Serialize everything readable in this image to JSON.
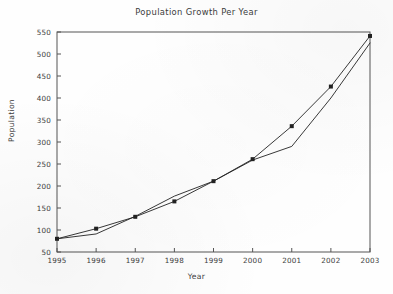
{
  "figure": {
    "title": "Population Growth Per Year",
    "xlabel": "Year",
    "ylabel": "Population",
    "background_color": "#fefefe",
    "line_color": "#222222",
    "axis_color": "#555555"
  },
  "chart_data": {
    "type": "line",
    "title": "Population Growth Per Year",
    "xlabel": "Year",
    "ylabel": "Population",
    "xlim": [
      1995,
      2003
    ],
    "ylim": [
      50,
      550
    ],
    "xticks": [
      1995,
      1996,
      1997,
      1998,
      1999,
      2000,
      2001,
      2002,
      2003
    ],
    "yticks": [
      50,
      100,
      150,
      200,
      250,
      300,
      350,
      400,
      450,
      500,
      550
    ],
    "xtick_labels": [
      "1995",
      "1996",
      "1997",
      "1998",
      "1999",
      "2000",
      "2001",
      "2002",
      "2003"
    ],
    "ytick_labels": [
      "50",
      "100",
      "150",
      "200",
      "250",
      "300",
      "350",
      "400",
      "450",
      "500",
      "550"
    ],
    "grid": false,
    "legend": false,
    "legend_position": "none",
    "x": [
      1995,
      1996,
      1997,
      1998,
      1999,
      2000,
      2001,
      2002,
      2003
    ],
    "series": [
      {
        "name": "Observed population",
        "marker": "square",
        "has_markers": true,
        "values": [
          80,
          103,
          130,
          165,
          211,
          261,
          336,
          426,
          541
        ]
      },
      {
        "name": "Fitted trend",
        "marker": "none",
        "has_markers": false,
        "values": [
          80,
          91,
          131,
          177,
          211,
          259,
          290,
          400,
          525
        ]
      }
    ]
  }
}
